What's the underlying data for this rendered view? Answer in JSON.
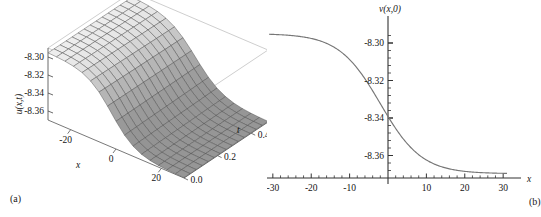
{
  "figure": {
    "background": "#ffffff",
    "panels": [
      {
        "caption": "(a)"
      },
      {
        "caption": "(b)"
      }
    ]
  },
  "chart_data": [
    {
      "type": "surface",
      "panel": "(a)",
      "title": "",
      "xlabel": "x",
      "ylabel": "t",
      "zlabel": "u(x,t)",
      "xlim": [
        -30,
        30
      ],
      "ylim": [
        0.0,
        0.5
      ],
      "zlim": [
        -8.37,
        -8.29
      ],
      "xticks": [
        -20,
        0,
        20
      ],
      "xticklabels": [
        "-20",
        "0",
        "20"
      ],
      "yticks": [
        0.0,
        0.2,
        0.4
      ],
      "yticklabels": [
        "0.0",
        "0.2",
        "0.4"
      ],
      "zticks": [
        -8.36,
        -8.34,
        -8.32,
        -8.3
      ],
      "zticklabels": [
        "-8.36",
        "-8.34",
        "-8.32",
        "-8.30"
      ],
      "grid": true,
      "colormap": "grayscale",
      "mesh_nx": 16,
      "mesh_ny": 14,
      "description": "Kink soliton surface u(x,t) descending from a plateau near -8.30 at large negative x to a trough near -8.37, broadening slightly with increasing t",
      "surface_samples": {
        "x": [
          -30,
          -24,
          -18,
          -12,
          -6,
          0,
          6,
          12,
          18,
          24,
          30
        ],
        "t": [
          0.0,
          0.1,
          0.2,
          0.3,
          0.4,
          0.5
        ],
        "z": [
          [
            -8.295,
            -8.296,
            -8.3,
            -8.312,
            -8.34,
            -8.362,
            -8.368,
            -8.369,
            -8.37,
            -8.37,
            -8.37
          ],
          [
            -8.295,
            -8.296,
            -8.3,
            -8.311,
            -8.338,
            -8.36,
            -8.367,
            -8.369,
            -8.37,
            -8.37,
            -8.37
          ],
          [
            -8.295,
            -8.296,
            -8.299,
            -8.31,
            -8.336,
            -8.358,
            -8.366,
            -8.368,
            -8.369,
            -8.37,
            -8.37
          ],
          [
            -8.295,
            -8.296,
            -8.299,
            -8.309,
            -8.333,
            -8.356,
            -8.365,
            -8.368,
            -8.369,
            -8.369,
            -8.37
          ],
          [
            -8.295,
            -8.296,
            -8.298,
            -8.307,
            -8.33,
            -8.353,
            -8.364,
            -8.367,
            -8.369,
            -8.369,
            -8.37
          ],
          [
            -8.295,
            -8.295,
            -8.298,
            -8.306,
            -8.327,
            -8.351,
            -8.363,
            -8.367,
            -8.368,
            -8.369,
            -8.369
          ]
        ]
      }
    },
    {
      "type": "line",
      "panel": "(b)",
      "title": "",
      "xlabel": "x",
      "ylabel": "v(x,0)",
      "xlim": [
        -31,
        31
      ],
      "ylim": [
        -8.372,
        -8.292
      ],
      "xticks": [
        -30,
        -20,
        -10,
        10,
        20,
        30
      ],
      "xticklabels": [
        "-30",
        "-20",
        "-10",
        "10",
        "20",
        "30"
      ],
      "yticks": [
        -8.36,
        -8.34,
        -8.32,
        -8.3
      ],
      "yticklabels": [
        "-8.36",
        "-8.34",
        "-8.32",
        "-8.30"
      ],
      "minor_tick_step_x": 2,
      "minor_tick_step_y": 0.004,
      "grid": false,
      "legend": null,
      "line_color": "#777777",
      "axis_color": "#333333",
      "description": "Monotonically decreasing sigmoid (kink) profile v(x,0) from a plateau of about -8.295 for x < -20 down to an asymptote of about -8.369 for x > 15, with the steepest descent near x = -2",
      "x": [
        -30,
        -28,
        -26,
        -24,
        -22,
        -20,
        -18,
        -16,
        -14,
        -12,
        -10,
        -8,
        -6,
        -4,
        -2,
        0,
        2,
        4,
        6,
        8,
        10,
        12,
        14,
        16,
        18,
        20,
        22,
        24,
        26,
        28,
        30
      ],
      "y": [
        -8.295,
        -8.2951,
        -8.2953,
        -8.2956,
        -8.296,
        -8.2966,
        -8.2975,
        -8.2989,
        -8.301,
        -8.304,
        -8.3083,
        -8.3143,
        -8.3218,
        -8.33,
        -8.3455,
        -8.354,
        -8.3613,
        -8.3657,
        -8.3678,
        -8.3688,
        -8.3692,
        -8.3694,
        -8.3695,
        -8.3696,
        -8.3696,
        -8.3696,
        -8.3697,
        -8.3697,
        -8.3697,
        -8.3697,
        -8.3697
      ]
    }
  ]
}
